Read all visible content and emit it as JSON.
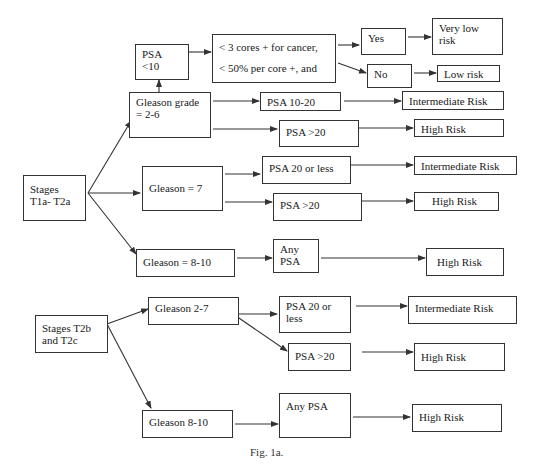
{
  "diagram": {
    "caption": "Fig. 1a.",
    "nodes": {
      "stages_t1a_t2a": [
        "Stages",
        "T1a- T2a"
      ],
      "gleason_2_6": [
        "Gleason grade",
        "= 2-6"
      ],
      "psa_lt10": [
        "PSA",
        "<10"
      ],
      "criteria": [
        "< 3 cores + for cancer,",
        "< 50% per core +, and"
      ],
      "yes": [
        "Yes"
      ],
      "no": [
        "No"
      ],
      "very_low_risk": [
        "Very low",
        "risk"
      ],
      "low_risk": [
        "Low risk"
      ],
      "psa_10_20": [
        "PSA 10-20"
      ],
      "intermediate_1": [
        "Intermediate Risk"
      ],
      "psa_gt20_1": [
        "PSA >20"
      ],
      "high_1": [
        "High Risk"
      ],
      "gleason_7": [
        "Gleason  = 7"
      ],
      "psa_20_or_less_1": [
        "PSA 20 or less"
      ],
      "intermediate_2": [
        "Intermediate Risk"
      ],
      "psa_gt20_2": [
        "PSA >20"
      ],
      "high_2": [
        "High Risk"
      ],
      "gleason_8_10_1": [
        "Gleason = 8-10"
      ],
      "any_psa_1": [
        "Any",
        "PSA"
      ],
      "high_3": [
        "High Risk"
      ],
      "stages_t2b_t2c": [
        "Stages T2b",
        "and T2c"
      ],
      "gleason_2_7": [
        "Gleason 2-7"
      ],
      "psa_20_or_less_2": [
        "PSA 20 or",
        "less"
      ],
      "intermediate_3": [
        "Intermediate Risk"
      ],
      "psa_gt20_3": [
        "PSA >20"
      ],
      "high_4": [
        "High Risk"
      ],
      "gleason_8_10_2": [
        "Gleason 8-10"
      ],
      "any_psa_2": [
        "Any PSA"
      ],
      "high_5": [
        "High Risk"
      ]
    },
    "edges": [
      [
        "stages_t1a_t2a",
        "gleason_2_6"
      ],
      [
        "stages_t1a_t2a",
        "gleason_7"
      ],
      [
        "stages_t1a_t2a",
        "gleason_8_10_1"
      ],
      [
        "gleason_2_6",
        "psa_lt10"
      ],
      [
        "psa_lt10",
        "criteria"
      ],
      [
        "criteria",
        "yes"
      ],
      [
        "criteria",
        "no"
      ],
      [
        "yes",
        "very_low_risk"
      ],
      [
        "no",
        "low_risk"
      ],
      [
        "gleason_2_6",
        "psa_10_20"
      ],
      [
        "psa_10_20",
        "intermediate_1"
      ],
      [
        "gleason_2_6",
        "psa_gt20_1"
      ],
      [
        "psa_gt20_1",
        "high_1"
      ],
      [
        "gleason_7",
        "psa_20_or_less_1"
      ],
      [
        "psa_20_or_less_1",
        "intermediate_2"
      ],
      [
        "gleason_7",
        "psa_gt20_2"
      ],
      [
        "psa_gt20_2",
        "high_2"
      ],
      [
        "gleason_8_10_1",
        "any_psa_1"
      ],
      [
        "any_psa_1",
        "high_3"
      ],
      [
        "stages_t2b_t2c",
        "gleason_2_7"
      ],
      [
        "stages_t2b_t2c",
        "gleason_8_10_2"
      ],
      [
        "gleason_2_7",
        "psa_20_or_less_2"
      ],
      [
        "psa_20_or_less_2",
        "intermediate_3"
      ],
      [
        "gleason_2_7",
        "psa_gt20_3"
      ],
      [
        "psa_gt20_3",
        "high_4"
      ],
      [
        "gleason_8_10_2",
        "any_psa_2"
      ],
      [
        "any_psa_2",
        "high_5"
      ]
    ]
  },
  "colors": {
    "line": "#333333",
    "text": "#1a1a1a",
    "background": "#ffffff"
  }
}
